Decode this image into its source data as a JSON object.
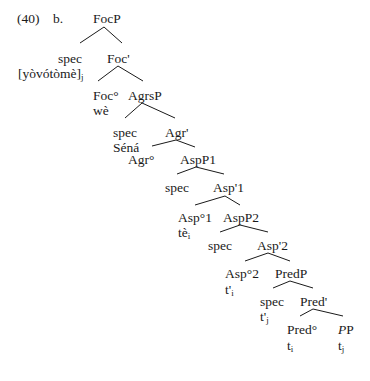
{
  "example": {
    "number": "(40)",
    "sub": "b."
  },
  "nodes": [
    {
      "id": "focp",
      "label": "FocP",
      "x": 93,
      "y": 11
    },
    {
      "id": "spec1",
      "label": "spec",
      "x": 58,
      "y": 51
    },
    {
      "id": "spec1w",
      "label": "[yòvótòmè]",
      "sub": "j",
      "x": 18,
      "y": 66
    },
    {
      "id": "focbar",
      "label": "Foc'",
      "x": 107,
      "y": 51
    },
    {
      "id": "foc0",
      "label": "Foc°",
      "x": 93,
      "y": 88
    },
    {
      "id": "foc0w",
      "label": "wè",
      "x": 93,
      "y": 103
    },
    {
      "id": "agrsp",
      "label": "AgrsP",
      "x": 128,
      "y": 88
    },
    {
      "id": "spec2",
      "label": "spec",
      "x": 113,
      "y": 125
    },
    {
      "id": "spec2w",
      "label": "Séná",
      "x": 113,
      "y": 140
    },
    {
      "id": "agrbar",
      "label": "Agr'",
      "x": 165,
      "y": 125
    },
    {
      "id": "agr0",
      "label": "Agr°",
      "x": 128,
      "y": 152
    },
    {
      "id": "aspp1",
      "label": "AspP1",
      "x": 180,
      "y": 152
    },
    {
      "id": "spec3",
      "label": "spec",
      "x": 165,
      "y": 180
    },
    {
      "id": "aspbar1",
      "label": "Asp'1",
      "x": 213,
      "y": 180
    },
    {
      "id": "asp01",
      "label": "Asp°1",
      "x": 178,
      "y": 210
    },
    {
      "id": "asp01w",
      "label": "tè",
      "sub": "i",
      "x": 178,
      "y": 225
    },
    {
      "id": "aspp2",
      "label": "AspP2",
      "x": 223,
      "y": 210
    },
    {
      "id": "spec4",
      "label": "spec",
      "x": 208,
      "y": 238
    },
    {
      "id": "aspbar2",
      "label": "Asp'2",
      "x": 257,
      "y": 238
    },
    {
      "id": "asp02",
      "label": "Asp°2",
      "x": 225,
      "y": 266
    },
    {
      "id": "asp02w",
      "label": "t'",
      "sub": "i",
      "x": 225,
      "y": 282
    },
    {
      "id": "predp",
      "label": "PredP",
      "x": 275,
      "y": 266
    },
    {
      "id": "spec5",
      "label": "spec",
      "x": 260,
      "y": 294
    },
    {
      "id": "spec5w",
      "label": "t'",
      "sub": "j",
      "x": 260,
      "y": 309
    },
    {
      "id": "predbar",
      "label": "Pred'",
      "x": 300,
      "y": 294
    },
    {
      "id": "pred0",
      "label": "Pred°",
      "x": 287,
      "y": 322
    },
    {
      "id": "pred0w",
      "label": "t",
      "sub": "i",
      "x": 287,
      "y": 338
    },
    {
      "id": "pp",
      "label": "P",
      "prefix": "P",
      "x": 338,
      "y": 322
    },
    {
      "id": "ppw",
      "label": "t",
      "sub": "j",
      "x": 338,
      "y": 338
    }
  ],
  "edges": [
    [
      104,
      27,
      80,
      43
    ],
    [
      104,
      27,
      122,
      43
    ],
    [
      118,
      66,
      98,
      81
    ],
    [
      118,
      66,
      143,
      81
    ],
    [
      142,
      103,
      125,
      118
    ],
    [
      142,
      103,
      175,
      118
    ],
    [
      176,
      140,
      152,
      146
    ],
    [
      176,
      140,
      195,
      147
    ],
    [
      196,
      167,
      177,
      174
    ],
    [
      196,
      167,
      224,
      174
    ],
    [
      225,
      196,
      195,
      205
    ],
    [
      225,
      196,
      240,
      205
    ],
    [
      240,
      225,
      220,
      232
    ],
    [
      240,
      225,
      268,
      232
    ],
    [
      268,
      253,
      245,
      261
    ],
    [
      268,
      253,
      290,
      261
    ],
    [
      290,
      281,
      273,
      288
    ],
    [
      290,
      281,
      313,
      288
    ],
    [
      313,
      309,
      300,
      316
    ],
    [
      313,
      309,
      343,
      316
    ]
  ],
  "colors": {
    "ink": "#1a1a1a",
    "background": "#ffffff"
  }
}
